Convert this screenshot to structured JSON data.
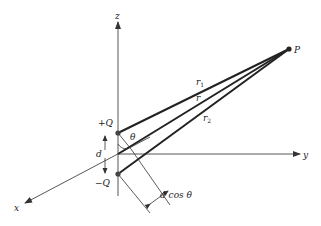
{
  "diagram": {
    "axes": {
      "z_label": "z",
      "y_label": "y",
      "x_label": "x"
    },
    "charges": {
      "positive_label": "+Q",
      "negative_label": "−Q"
    },
    "point_label": "P",
    "distances": {
      "r1_label": "r",
      "r1_sub": "1",
      "r_label": "r",
      "r2_label": "r",
      "r2_sub": "2"
    },
    "angle_label": "θ",
    "separation_label": "d",
    "projection_label": "d cos θ",
    "colors": {
      "line": "#222222",
      "axis": "#444444",
      "background": "#ffffff"
    }
  }
}
